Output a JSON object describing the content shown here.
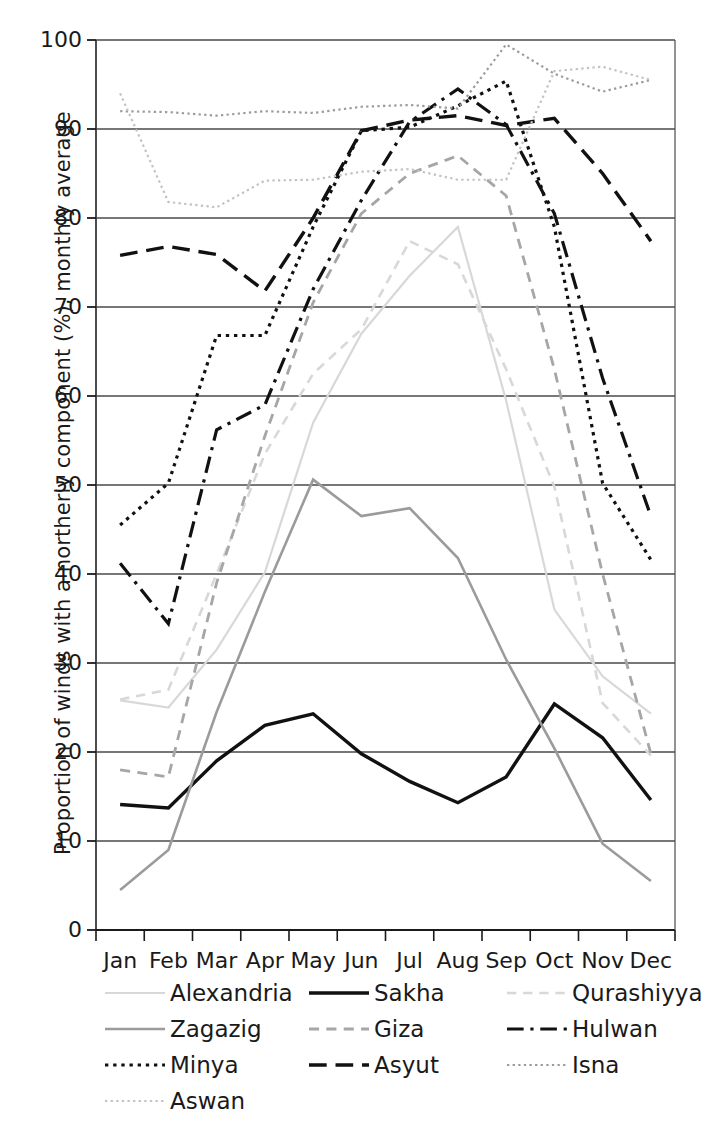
{
  "chart_data": {
    "type": "line",
    "title": "",
    "xlabel": "",
    "ylabel": "Proportion of winds with a northerly component (%), monthly average",
    "categories": [
      "Jan",
      "Feb",
      "Mar",
      "Apr",
      "May",
      "Jun",
      "Jul",
      "Aug",
      "Sep",
      "Oct",
      "Nov",
      "Dec"
    ],
    "ylim": [
      0,
      100
    ],
    "ytick_labels": [
      "0",
      "10",
      "20",
      "30",
      "40",
      "50",
      "60",
      "70",
      "80",
      "90",
      "100"
    ],
    "ytick_values": [
      0,
      10,
      20,
      30,
      40,
      50,
      60,
      70,
      80,
      90,
      100
    ],
    "grid": "horizontal",
    "legend_position": "bottom",
    "series": [
      {
        "name": "Alexandria",
        "style": "solid",
        "color": "#d8d8d8",
        "width": 2.2,
        "values": [
          25.8,
          25.0,
          31.5,
          40.2,
          57.0,
          67.0,
          73.5,
          79.0,
          59.5,
          36.0,
          28.5,
          24.3
        ]
      },
      {
        "name": "Sakha",
        "style": "solid",
        "color": "#111111",
        "width": 3.4,
        "values": [
          14.1,
          13.7,
          19.0,
          23.0,
          24.3,
          19.8,
          16.7,
          14.3,
          17.2,
          25.4,
          21.6,
          14.6
        ]
      },
      {
        "name": "Qurashiyya",
        "style": "dashed",
        "color": "#d8d8d8",
        "width": 2.6,
        "values": [
          25.9,
          27.0,
          40.0,
          53.5,
          62.5,
          67.5,
          77.4,
          74.8,
          63.0,
          49.8,
          25.5,
          19.6
        ]
      },
      {
        "name": "Zagazig",
        "style": "solid",
        "color": "#9b9b9b",
        "width": 2.6,
        "values": [
          4.5,
          9.0,
          24.5,
          38.0,
          50.6,
          46.5,
          47.4,
          41.8,
          30.4,
          20.4,
          9.7,
          5.5
        ]
      },
      {
        "name": "Giza",
        "style": "dashed",
        "color": "#a6a6a6",
        "width": 2.8,
        "values": [
          18.0,
          17.2,
          39.0,
          55.5,
          70.5,
          80.5,
          85.0,
          87.0,
          82.5,
          63.0,
          40.0,
          19.8
        ]
      },
      {
        "name": "Hulwan",
        "style": "dashdot",
        "color": "#111111",
        "width": 3.2,
        "values": [
          41.2,
          34.4,
          56.2,
          59.0,
          72.0,
          82.0,
          90.8,
          94.5,
          90.5,
          80.5,
          62.0,
          46.5
        ]
      },
      {
        "name": "Minya",
        "style": "dotted",
        "color": "#111111",
        "width": 3.2,
        "values": [
          45.5,
          50.2,
          66.8,
          66.8,
          79.0,
          89.8,
          90.2,
          92.6,
          95.4,
          79.0,
          50.2,
          41.6
        ]
      },
      {
        "name": "Asyut",
        "style": "longdash",
        "color": "#111111",
        "width": 3.4,
        "values": [
          75.8,
          76.8,
          75.9,
          71.8,
          80.0,
          89.8,
          91.0,
          91.5,
          90.4,
          91.2,
          85.0,
          77.4
        ]
      },
      {
        "name": "Isna",
        "style": "dotted",
        "color": "#9b9b9b",
        "width": 2.2,
        "values": [
          92.0,
          91.9,
          91.5,
          92.0,
          91.8,
          92.5,
          92.7,
          92.3,
          99.5,
          96.2,
          94.2,
          95.5
        ]
      },
      {
        "name": "Aswan",
        "style": "dotted",
        "color": "#c2c2c2",
        "width": 2.2,
        "values": [
          94.0,
          81.8,
          81.2,
          84.2,
          84.3,
          85.2,
          85.5,
          84.3,
          84.3,
          96.5,
          97.0,
          95.5
        ]
      }
    ]
  },
  "legend": {
    "rows": [
      [
        {
          "name": "Alexandria"
        },
        {
          "name": "Sakha"
        },
        {
          "name": "Qurashiyya"
        }
      ],
      [
        {
          "name": "Zagazig"
        },
        {
          "name": "Giza"
        },
        {
          "name": "Hulwan"
        }
      ],
      [
        {
          "name": "Minya"
        },
        {
          "name": "Asyut"
        },
        {
          "name": "Isna"
        }
      ],
      [
        {
          "name": "Aswan"
        }
      ]
    ]
  }
}
